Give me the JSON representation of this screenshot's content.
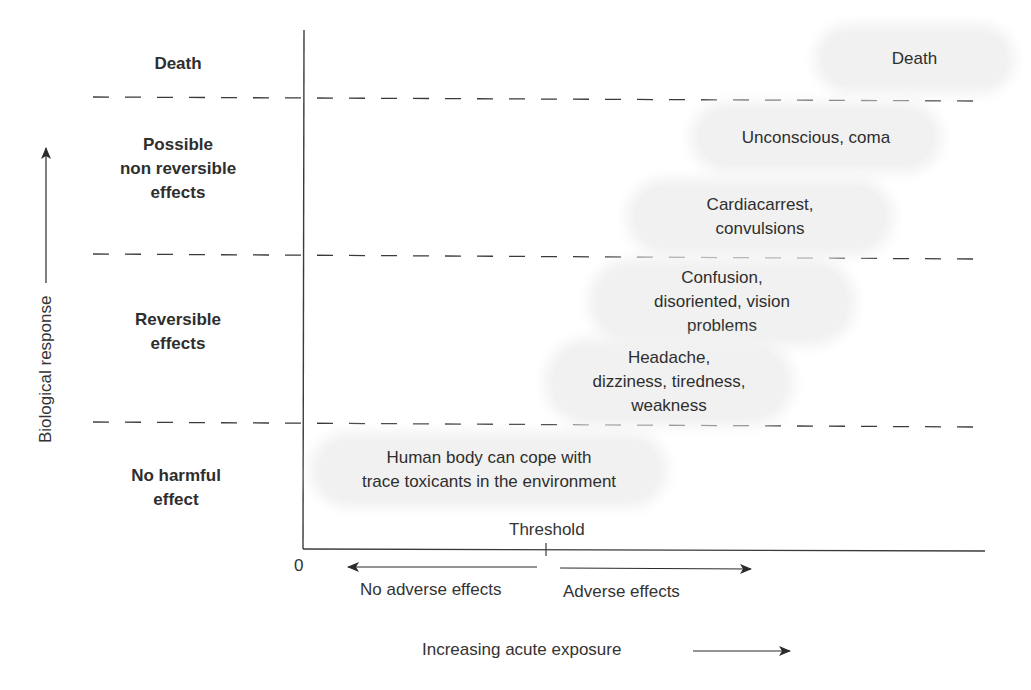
{
  "figure": {
    "y_axis": {
      "label": "Biological response",
      "origin_label": "0"
    },
    "x_axis": {
      "label": "Increasing acute exposure",
      "threshold_label": "Threshold",
      "left_region_label": "No adverse effects",
      "right_region_label": "Adverse effects"
    },
    "zones": [
      {
        "label": "Death"
      },
      {
        "label": "Possible\nnon reversible\neffects"
      },
      {
        "label": "Reversible\neffects"
      },
      {
        "label": "No harmful\neffect"
      }
    ],
    "effects": [
      {
        "text": "Death",
        "zone": "Death"
      },
      {
        "text": "Unconscious, coma",
        "zone": "Possible non reversible effects"
      },
      {
        "text": "Cardiacarrest,\nconvulsions",
        "zone": "Possible non reversible effects"
      },
      {
        "text": "Confusion,\ndisoriented, vision\nproblems",
        "zone": "Reversible effects"
      },
      {
        "text": "Headache,\ndizziness, tiredness,\nweakness",
        "zone": "Reversible effects"
      },
      {
        "text": "Human body can cope with\ntrace toxicants in the environment",
        "zone": "No harmful effect"
      }
    ],
    "colors": {
      "bubble": "#f1f1f1",
      "line": "#3a3a3a",
      "text": "#2e2e2e"
    }
  }
}
